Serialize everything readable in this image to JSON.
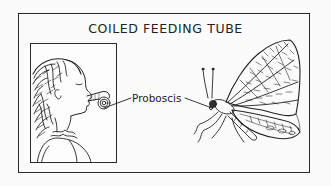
{
  "figure": {
    "title": "COILED FEEDING TUBE",
    "label": "Proboscis",
    "panels": [
      {
        "subject": "girl-with-party-blower",
        "description": "Child blowing a coiled party blower, analog of a proboscis"
      },
      {
        "subject": "butterfly",
        "description": "Butterfly in side view with coiled proboscis"
      }
    ],
    "colors": {
      "ink": "#222222",
      "paper": "#fbfbfb"
    }
  }
}
